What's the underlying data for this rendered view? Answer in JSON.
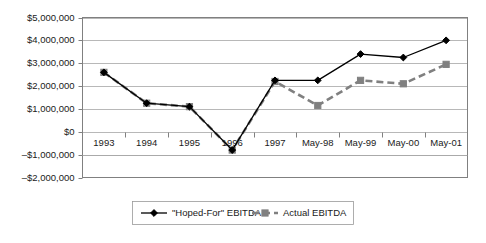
{
  "chart_data": {
    "type": "line",
    "title": "",
    "xlabel": "",
    "ylabel": "",
    "grid": true,
    "legend_position": "bottom",
    "categories": [
      "1993",
      "1994",
      "1995",
      "1996",
      "1997",
      "May-98",
      "May-99",
      "May-00",
      "May-01"
    ],
    "ylim": [
      -2000000,
      5000000
    ],
    "ytick_labels": [
      "$5,000,000",
      "$4,000,000",
      "$3,000,000",
      "$2,000,000",
      "$1,000,000",
      "$0",
      "–$1,000,000",
      "–$2,000,000"
    ],
    "ytick_values": [
      5000000,
      4000000,
      3000000,
      2000000,
      1000000,
      0,
      -1000000,
      -2000000
    ],
    "series": [
      {
        "name": "\"Hoped-For\" EBITDA",
        "color": "#000000",
        "marker": "diamond",
        "line_style": "solid",
        "values": [
          2600000,
          1250000,
          1100000,
          -800000,
          2250000,
          2250000,
          3400000,
          3250000,
          4000000
        ]
      },
      {
        "name": "Actual EBITDA",
        "color": "#808080",
        "marker": "square",
        "line_style": "dashed",
        "values": [
          2600000,
          1250000,
          1100000,
          -800000,
          2200000,
          1150000,
          2250000,
          2100000,
          2950000
        ]
      }
    ]
  },
  "legend": {
    "items": [
      {
        "label": "\"Hoped-For\" EBITDA"
      },
      {
        "label": "Actual EBITDA"
      }
    ]
  }
}
